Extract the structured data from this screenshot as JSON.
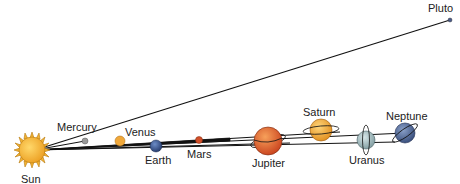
{
  "diagram": {
    "colors": {
      "sun": "#f2b233",
      "mercury": "#9a9a9a",
      "venus": "#f0a83a",
      "earth": "#3e5f9e",
      "mars": "#d2502a",
      "jupiter": "#e0602a",
      "saturn": "#f0b03a",
      "uranus": "#a9c3c6",
      "neptune": "#4f6a9a",
      "pluto": "#4a5a8a",
      "line": "#111111"
    },
    "labels": {
      "sun": "Sun",
      "mercury": "Mercury",
      "venus": "Venus",
      "earth": "Earth",
      "mars": "Mars",
      "jupiter": "Jupiter",
      "saturn": "Saturn",
      "uranus": "Uranus",
      "neptune": "Neptune",
      "pluto": "Pluto"
    }
  }
}
